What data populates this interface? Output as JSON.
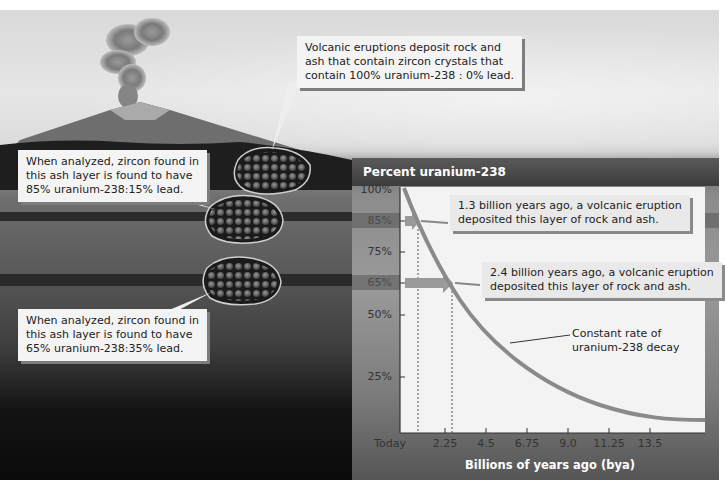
{
  "callouts": {
    "eruption": "Volcanic eruptions deposit rock and|ash that contain zircon crystals that|contain 100% uranium-238 : 0% lead.",
    "layer85": "When analyzed, zircon found in|this ash layer is found to have|85% uranium-238:15% lead.",
    "layer65": "When analyzed, zircon found in|this ash layer is found to have|65% uranium-238:35% lead."
  },
  "chart": {
    "title": "Percent uranium-238",
    "xlabel": "Billions of years ago (bya)",
    "annotation_13": "1.3 billion years ago, a volcanic eruption|deposited this layer of rock and ash.",
    "annotation_24": "2.4 billion years ago, a volcanic eruption|deposited this layer of rock and ash.",
    "curve_label": "Constant rate of|uranium-238 decay"
  },
  "colors": {
    "curve": "#8a8a8a",
    "arrow": "#9a9a9a",
    "plot_bg": "#f3f3f3"
  },
  "chart_data": {
    "type": "line",
    "title": "Percent uranium-238",
    "xlabel": "Billions of years ago (bya)",
    "ylabel": "Percent uranium-238",
    "x_tick_labels": [
      "Today",
      "2.25",
      "4.5",
      "6.75",
      "9.0",
      "11.25",
      "13.5"
    ],
    "y_tick_labels": [
      "100%",
      "85%",
      "75%",
      "65%",
      "50%",
      "25%"
    ],
    "y_ticks": [
      100,
      85,
      75,
      65,
      50,
      25
    ],
    "series": [
      {
        "name": "Constant rate of uranium-238 decay",
        "x": [
          0,
          1.3,
          2.4,
          4.5,
          6.75,
          9.0,
          11.25,
          13.5,
          15.5
        ],
        "y": [
          100,
          85,
          65,
          50,
          33,
          22,
          15,
          12,
          11
        ]
      }
    ],
    "markers": [
      {
        "x": 1.3,
        "y": 85,
        "label": "1.3 billion years ago, a volcanic eruption deposited this layer of rock and ash."
      },
      {
        "x": 2.4,
        "y": 65,
        "label": "2.4 billion years ago, a volcanic eruption deposited this layer of rock and ash."
      }
    ],
    "grid": false,
    "ylim": [
      0,
      100
    ]
  }
}
